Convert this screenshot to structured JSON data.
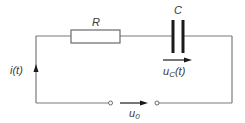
{
  "diagram": {
    "type": "RC series circuit",
    "components": {
      "resistor": {
        "label": "R"
      },
      "capacitor": {
        "label": "C"
      }
    },
    "labels": {
      "current": "i(t)",
      "capacitor_voltage_main": "u",
      "capacitor_voltage_sub": "C",
      "capacitor_voltage_tail": "(t)",
      "source_voltage_main": "u",
      "source_voltage_sub": "0"
    },
    "colors": {
      "wire": "#7a7a7a",
      "plate": "#1a1a1a",
      "text": "#3a3a3a",
      "background": "#ffffff"
    }
  }
}
